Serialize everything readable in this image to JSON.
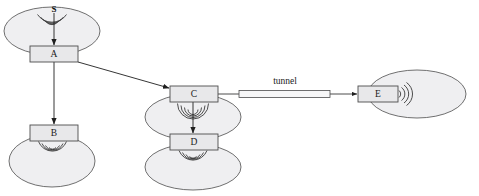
{
  "figure": {
    "type": "network-topology-diagram",
    "title_fragment": "",
    "background_color": "#ffffff",
    "cell_fill": "#efeff1",
    "stroke_color": "#4d4d4d",
    "node_fill": "#e8e8ea",
    "text_color": "#1a1a1a"
  },
  "labels": {
    "source": "S",
    "tunnel": "tunnel"
  },
  "nodes": [
    {
      "id": "A",
      "label": "A",
      "x": 30,
      "y": 46,
      "w": 48,
      "h": 16
    },
    {
      "id": "B",
      "label": "B",
      "x": 30,
      "y": 125,
      "w": 48,
      "h": 16
    },
    {
      "id": "C",
      "label": "C",
      "x": 170,
      "y": 86,
      "w": 48,
      "h": 16
    },
    {
      "id": "D",
      "label": "D",
      "x": 170,
      "y": 134,
      "w": 48,
      "h": 16
    },
    {
      "id": "E",
      "label": "E",
      "x": 358,
      "y": 86,
      "w": 40,
      "h": 16
    }
  ],
  "cells": [
    {
      "id": "cell-a",
      "cx": 52,
      "cy": 31,
      "rx": 48,
      "ry": 24,
      "of": "A"
    },
    {
      "id": "cell-b",
      "cx": 52,
      "cy": 161,
      "rx": 43,
      "ry": 26,
      "of": "B"
    },
    {
      "id": "cell-c",
      "cx": 193,
      "cy": 117,
      "rx": 48,
      "ry": 23,
      "of": "C"
    },
    {
      "id": "cell-d",
      "cx": 193,
      "cy": 167,
      "rx": 48,
      "ry": 23,
      "of": "D"
    },
    {
      "id": "cell-e",
      "cx": 417,
      "cy": 94,
      "rx": 49,
      "ry": 24,
      "of": "E"
    }
  ],
  "wireless_links": [
    {
      "id": "s-to-a",
      "from": "S",
      "to": "A",
      "direction": "down"
    },
    {
      "id": "b-broadcast",
      "from": "B",
      "to": "",
      "direction": "down"
    },
    {
      "id": "c-to-d",
      "from": "C",
      "to": "D",
      "direction": "down"
    },
    {
      "id": "d-broadcast",
      "from": "D",
      "to": "",
      "direction": "down"
    },
    {
      "id": "e-broadcast",
      "from": "E",
      "to": "",
      "direction": "right"
    }
  ],
  "wired_links": [
    {
      "id": "a-to-b",
      "from": "A",
      "to": "B",
      "style": "arrow-vertical"
    },
    {
      "id": "a-to-c",
      "from": "A",
      "to": "C",
      "style": "arrow-diagonal"
    },
    {
      "id": "c-to-e",
      "from": "C",
      "to": "E",
      "style": "tunnel",
      "label": "tunnel"
    }
  ]
}
